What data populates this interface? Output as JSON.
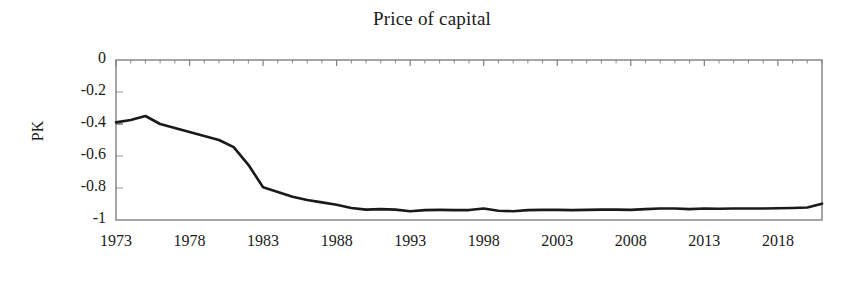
{
  "chart_data": {
    "type": "line",
    "title": "Price of capital",
    "xlabel": "",
    "ylabel": "PK",
    "xlim": [
      1973,
      2021
    ],
    "ylim": [
      -1,
      0
    ],
    "grid": false,
    "legend": null,
    "xticks": [
      "1973",
      "1978",
      "1983",
      "1988",
      "1993",
      "1998",
      "2003",
      "2008",
      "2013",
      "2018"
    ],
    "xtick_values": [
      1973,
      1978,
      1983,
      1988,
      1993,
      1998,
      2003,
      2008,
      2013,
      2018
    ],
    "yticks": [
      "0",
      "-0.2",
      "-0.4",
      "-0.6",
      "-0.8",
      "-1"
    ],
    "ytick_values": [
      0,
      -0.2,
      -0.4,
      -0.6,
      -0.8,
      -1
    ],
    "line_color": "#1a1a1a",
    "axis_color": "#808080",
    "series": [
      {
        "name": "PK",
        "x": [
          1973,
          1974,
          1975,
          1976,
          1977,
          1978,
          1979,
          1980,
          1981,
          1982,
          1983,
          1984,
          1985,
          1986,
          1987,
          1988,
          1989,
          1990,
          1991,
          1992,
          1993,
          1994,
          1995,
          1996,
          1997,
          1998,
          1999,
          2000,
          2001,
          2002,
          2003,
          2004,
          2005,
          2006,
          2007,
          2008,
          2009,
          2010,
          2011,
          2012,
          2013,
          2014,
          2015,
          2016,
          2017,
          2018,
          2019,
          2020,
          2021
        ],
        "values": [
          -0.39,
          -0.375,
          -0.35,
          -0.4,
          -0.425,
          -0.45,
          -0.475,
          -0.5,
          -0.545,
          -0.655,
          -0.795,
          -0.825,
          -0.855,
          -0.875,
          -0.89,
          -0.905,
          -0.925,
          -0.935,
          -0.932,
          -0.935,
          -0.945,
          -0.938,
          -0.937,
          -0.938,
          -0.938,
          -0.928,
          -0.942,
          -0.945,
          -0.938,
          -0.937,
          -0.937,
          -0.938,
          -0.937,
          -0.935,
          -0.935,
          -0.937,
          -0.932,
          -0.928,
          -0.928,
          -0.932,
          -0.928,
          -0.93,
          -0.928,
          -0.928,
          -0.928,
          -0.927,
          -0.925,
          -0.922,
          -0.898
        ]
      }
    ]
  }
}
